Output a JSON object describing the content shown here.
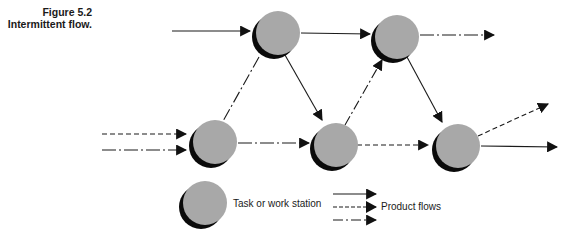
{
  "figure": {
    "number": "Figure 5.2",
    "title": "Intermittent flow."
  },
  "colors": {
    "node_fill": "#a8a8a8",
    "node_shadow": "#0a0a0a",
    "line": "#1a1a1a"
  },
  "nodes": [
    {
      "id": "n1",
      "label": "task-top-left",
      "cx": 278,
      "cy": 33
    },
    {
      "id": "n2",
      "label": "task-top-right",
      "cx": 397,
      "cy": 37
    },
    {
      "id": "n3",
      "label": "task-bottom-left",
      "cx": 215,
      "cy": 142
    },
    {
      "id": "n4",
      "label": "task-bottom-middle",
      "cx": 336,
      "cy": 145
    },
    {
      "id": "n5",
      "label": "task-bottom-right",
      "cx": 458,
      "cy": 146
    }
  ],
  "edges": [
    {
      "from": "input",
      "to": "n1",
      "style": "solid"
    },
    {
      "from": "n1",
      "to": "n2",
      "style": "solid"
    },
    {
      "from": "n2",
      "to": "output",
      "style": "dash-dot"
    },
    {
      "from": "n1",
      "to": "n3",
      "style": "dash-dot"
    },
    {
      "from": "n1",
      "to": "n4",
      "style": "solid"
    },
    {
      "from": "input",
      "to": "n3",
      "style": "dashed"
    },
    {
      "from": "input",
      "to": "n3",
      "style": "dash-dot"
    },
    {
      "from": "n3",
      "to": "n4",
      "style": "dash-dot"
    },
    {
      "from": "n4",
      "to": "n2",
      "style": "dash-dot"
    },
    {
      "from": "n2",
      "to": "n5",
      "style": "solid"
    },
    {
      "from": "n4",
      "to": "n5",
      "style": "dashed"
    },
    {
      "from": "n5",
      "to": "output",
      "style": "dashed"
    },
    {
      "from": "n5",
      "to": "output",
      "style": "solid"
    }
  ],
  "legend": {
    "node_label": "Task or work station",
    "flow_label": "Product flows",
    "flow_styles": [
      "solid",
      "dashed",
      "dash-dot"
    ]
  }
}
